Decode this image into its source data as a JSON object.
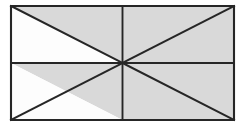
{
  "figure": {
    "shape_type": "rectangle",
    "caption": "",
    "colors": {
      "shaded_fill": "#d9d9d9",
      "unshaded_fill": "#fdfdfd",
      "line": "#262626",
      "background": "#ffffff"
    },
    "geometry": {
      "left": 11,
      "top": 6,
      "right": 234,
      "bottom": 120,
      "width": 223,
      "height": 114,
      "center_x": 122.5,
      "center_y": 63,
      "vertical_midline_x": 122.5,
      "horizontal_midline_y": 63
    },
    "counts": {
      "total_triangles": 8,
      "shaded_triangles": 6,
      "unshaded_triangles": 2
    },
    "vertices": {
      "top_left": "11,6",
      "top_mid": "122.5,6",
      "top_right": "234,6",
      "mid_left": "11,63",
      "center": "122.5,63",
      "mid_right": "234,63",
      "bottom_left": "11,120",
      "bottom_mid": "122.5,120",
      "bottom_right": "234,120"
    },
    "lines": [
      {
        "name": "outline-rectangle",
        "points": "11,6 234,6 234,120 11,120 11,6",
        "kind": "outline"
      },
      {
        "name": "vertical-midline",
        "points": "122.5,6 122.5,120",
        "kind": "median"
      },
      {
        "name": "horizontal-midline",
        "points": "11,63 234,63",
        "kind": "median"
      },
      {
        "name": "diagonal-top-left-to-center",
        "points": "11,6 122.5,63",
        "kind": "diagonal"
      },
      {
        "name": "diagonal-center-to-top-right",
        "points": "122.5,63 234,6",
        "kind": "diagonal"
      },
      {
        "name": "diagonal-bottom-left-to-center",
        "points": "11,120 122.5,63",
        "kind": "diagonal"
      },
      {
        "name": "diagonal-center-to-bottom-right",
        "points": "122.5,63 234,120",
        "kind": "diagonal"
      }
    ],
    "triangles": [
      {
        "name": "upper-left-upper-triangle",
        "quadrant": "top-left",
        "position": "above-diagonal",
        "shaded": true,
        "points": "11,6 122.5,6 122.5,63"
      },
      {
        "name": "upper-left-lower-triangle",
        "quadrant": "top-left",
        "position": "below-diagonal",
        "shaded": false,
        "points": "11,6 122.5,63 11,63"
      },
      {
        "name": "upper-right-upper-triangle",
        "quadrant": "top-right",
        "position": "above-diagonal",
        "shaded": true,
        "points": "122.5,6 234,6 122.5,63"
      },
      {
        "name": "upper-right-lower-triangle",
        "quadrant": "top-right",
        "position": "below-diagonal",
        "shaded": true,
        "points": "234,6 234,63 122.5,63"
      },
      {
        "name": "lower-left-upper-triangle",
        "quadrant": "bottom-left",
        "position": "above-diagonal",
        "shaded": true,
        "points": "11,63 122.5,63 122.5,120"
      },
      {
        "name": "lower-left-lower-triangle",
        "quadrant": "bottom-left",
        "position": "below-diagonal",
        "shaded": false,
        "points": "11,63 122.5,120 11,120"
      },
      {
        "name": "lower-right-upper-triangle",
        "quadrant": "bottom-right",
        "position": "above-diagonal",
        "shaded": true,
        "points": "122.5,63 234,63 234,120"
      },
      {
        "name": "lower-right-lower-triangle",
        "quadrant": "bottom-right",
        "position": "below-diagonal",
        "shaded": true,
        "points": "122.5,63 234,120 122.5,120"
      }
    ]
  }
}
